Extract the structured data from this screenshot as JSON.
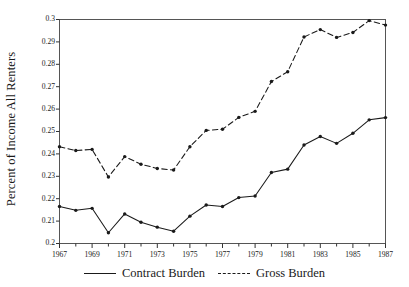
{
  "chart_data": {
    "type": "line",
    "title": "",
    "xlabel": "",
    "ylabel": "Percent of Income All Renters",
    "xlim": [
      1967,
      1987
    ],
    "ylim": [
      0.2,
      0.3
    ],
    "grid": false,
    "legend_position": "bottom",
    "x": [
      1967,
      1968,
      1969,
      1970,
      1971,
      1972,
      1973,
      1974,
      1975,
      1976,
      1977,
      1978,
      1979,
      1980,
      1981,
      1982,
      1983,
      1984,
      1985,
      1986,
      1987
    ],
    "xtick_labels": [
      "1967",
      "1969",
      "1971",
      "1973",
      "1975",
      "1977",
      "1979",
      "1981",
      "1983",
      "1985",
      "1987"
    ],
    "xtick_values": [
      1967,
      1969,
      1971,
      1973,
      1975,
      1977,
      1979,
      1981,
      1983,
      1985,
      1987
    ],
    "ytick_labels": [
      "0.2",
      "0.21",
      "0.22",
      "0.23",
      "0.24",
      "0.25",
      "0.26",
      "0.27",
      "0.28",
      "0.29",
      "0.3"
    ],
    "ytick_values": [
      0.2,
      0.21,
      0.22,
      0.23,
      0.24,
      0.25,
      0.26,
      0.27,
      0.28,
      0.29,
      0.3
    ],
    "series": [
      {
        "name": "Contract Burden",
        "style": "solid",
        "color": "#1a1a1a",
        "marker": "circle",
        "values": [
          0.2165,
          0.2148,
          0.2157,
          0.2048,
          0.2132,
          0.2095,
          0.2073,
          0.2055,
          0.2122,
          0.2172,
          0.2165,
          0.2205,
          0.2212,
          0.2317,
          0.2332,
          0.244,
          0.2478,
          0.2447,
          0.2492,
          0.2552,
          0.2562
        ]
      },
      {
        "name": "Gross Burden",
        "style": "dashed",
        "color": "#1a1a1a",
        "marker": "circle",
        "values": [
          0.2432,
          0.2415,
          0.242,
          0.2297,
          0.2388,
          0.2354,
          0.2335,
          0.2328,
          0.2432,
          0.2505,
          0.251,
          0.2563,
          0.259,
          0.2723,
          0.2767,
          0.2922,
          0.2955,
          0.292,
          0.2942,
          0.2995,
          0.2975
        ]
      }
    ]
  },
  "legend": {
    "entries": [
      {
        "label": "Contract Burden",
        "style": "solid"
      },
      {
        "label": "Gross Burden",
        "style": "dashed"
      }
    ]
  },
  "axis": {
    "y_title": "Percent of Income All Renters"
  }
}
